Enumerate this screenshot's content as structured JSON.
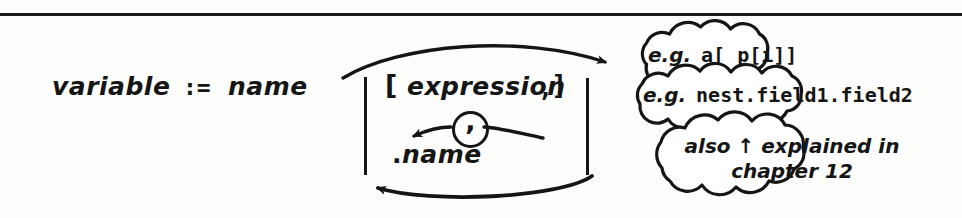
{
  "page": {
    "kind": "hand-drawn-syntax-railroad-diagram",
    "ghost_text": "",
    "ink_color": "#151515",
    "paper_color": "#fdfdfc"
  },
  "production": {
    "lhs": "variable",
    "assign_operator": ":=",
    "first_alternative": "name"
  },
  "alternation_block": {
    "index_branch": {
      "open_bracket": "[",
      "item": "expression",
      "trailing_comma": ",",
      "close_bracket": "]",
      "repeat_separator": ","
    },
    "field_branch": {
      "dot": ".",
      "item": "name"
    }
  },
  "annotations": [
    {
      "id": "cloud-eg-index",
      "prefix": "e.g.",
      "code": "a[ p[i]]"
    },
    {
      "id": "cloud-eg-field",
      "prefix": "e.g.",
      "code": "nest.field1.field2"
    },
    {
      "id": "cloud-chapter-note",
      "line1": "also ↑ explained in",
      "line2": "chapter 12"
    }
  ]
}
